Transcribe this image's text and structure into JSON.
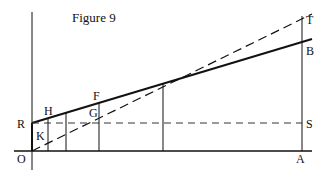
{
  "figure": {
    "title": "Figure 9",
    "points": {
      "O": "O",
      "R": "R",
      "H": "H",
      "K": "K",
      "F": "F",
      "G": "G",
      "T": "T",
      "B": "B",
      "S": "S",
      "A": "A"
    },
    "colors": {
      "ink": "#111111",
      "background": "#ffffff"
    },
    "lines": [
      {
        "name": "y-axis",
        "style": "solid",
        "from": [
          32,
          12
        ],
        "to": [
          32,
          170
        ]
      },
      {
        "name": "x-axis",
        "style": "solid",
        "from": [
          14,
          151
        ],
        "to": [
          312,
          151
        ]
      },
      {
        "name": "line-RB",
        "style": "solid-thick",
        "from": [
          32,
          123
        ],
        "to": [
          312,
          39
        ]
      },
      {
        "name": "line-OT",
        "style": "dashed",
        "from": [
          32,
          151
        ],
        "to": [
          312,
          14
        ]
      },
      {
        "name": "line-RS",
        "style": "dashed",
        "from": [
          32,
          123
        ],
        "to": [
          302,
          123
        ]
      },
      {
        "name": "line-AT",
        "style": "solid",
        "from": [
          302,
          16
        ],
        "to": [
          302,
          151
        ]
      },
      {
        "name": "segment-OR",
        "style": "solid-thick",
        "from": [
          32,
          151
        ],
        "to": [
          32,
          123
        ]
      }
    ],
    "verticals_x": [
      48,
      66,
      99,
      163
    ]
  }
}
